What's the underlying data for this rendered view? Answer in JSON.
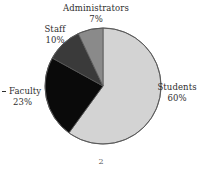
{
  "page": {
    "background_color": "#ffffff",
    "width": 202,
    "height": 188,
    "footer_number": "2"
  },
  "labels": {
    "administrators": {
      "name": "Administrators",
      "percent": "7%"
    },
    "staff": {
      "name": "Staff",
      "percent": "10%"
    },
    "faculty": {
      "name": "Faculty",
      "percent": "23%"
    },
    "students": {
      "name": "Students",
      "percent": "60%"
    }
  },
  "chart_data": {
    "type": "pie",
    "title": "",
    "subtitle": "",
    "xlabel": "",
    "ylabel": "",
    "legend_position": "none",
    "labels_position": "outside-callout",
    "grid": false,
    "start_angle_deg": 0,
    "direction": "clockwise",
    "units": "percent",
    "total": 100,
    "categories": [
      "Students",
      "Faculty",
      "Staff",
      "Administrators"
    ],
    "values": [
      60,
      23,
      10,
      7
    ],
    "colors": [
      "#d3d3d3",
      "#0a0a0a",
      "#3a3a3a",
      "#8a8a8a"
    ],
    "slices": [
      {
        "label": "Students",
        "value": 60,
        "display": "60%",
        "color": "#d3d3d3",
        "start_deg": 0,
        "end_deg": 216
      },
      {
        "label": "Faculty",
        "value": 23,
        "display": "23%",
        "color": "#0a0a0a",
        "start_deg": 216,
        "end_deg": 298.8
      },
      {
        "label": "Staff",
        "value": 10,
        "display": "10%",
        "color": "#3a3a3a",
        "start_deg": 298.8,
        "end_deg": 334.8
      },
      {
        "label": "Administrators",
        "value": 7,
        "display": "7%",
        "color": "#8a8a8a",
        "start_deg": 334.8,
        "end_deg": 360
      }
    ],
    "geometry": {
      "center_x": 103,
      "center_y": 86,
      "radius": 58
    },
    "stroke_color": "#555555"
  }
}
